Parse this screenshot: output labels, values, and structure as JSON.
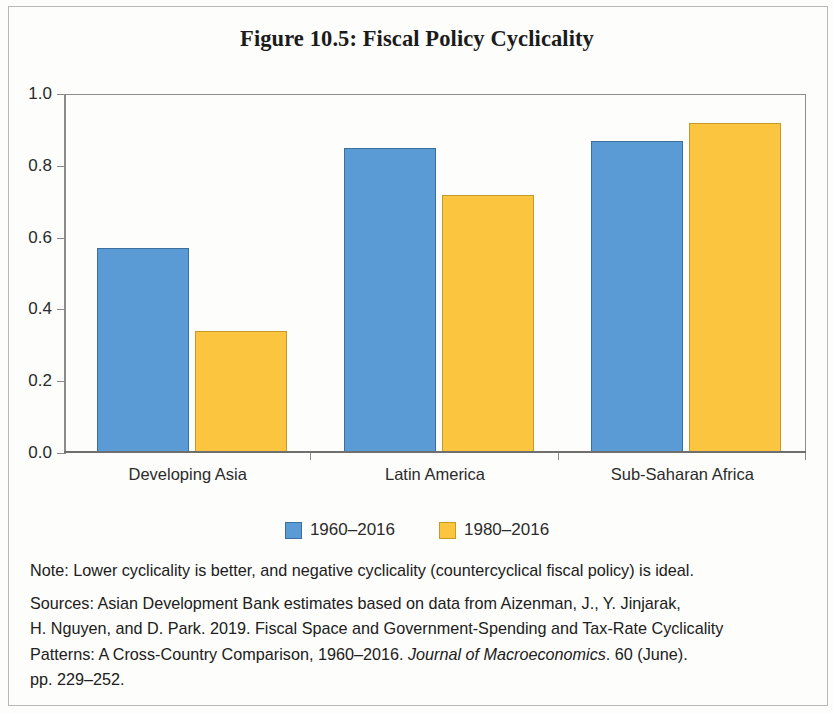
{
  "chart_data": {
    "type": "bar",
    "title": "Figure 10.5: Fiscal Policy Cyclicality",
    "subtitle": "",
    "xlabel": "",
    "ylabel": "",
    "ylim": [
      0.0,
      1.0
    ],
    "grid": false,
    "legend_position": "bottom-center",
    "categories": [
      "Developing Asia",
      "Latin America",
      "Sub-Saharan Africa"
    ],
    "y_ticks": [
      "0.0",
      "0.2",
      "0.4",
      "0.6",
      "0.8",
      "1.0"
    ],
    "y_tick_values": [
      0.0,
      0.2,
      0.4,
      0.6,
      0.8,
      1.0
    ],
    "series": [
      {
        "name": "1960–2016",
        "color": "#5B9BD5",
        "border_color": "#3D6F9E",
        "values": [
          0.57,
          0.85,
          0.87
        ]
      },
      {
        "name": "1980–2016",
        "color": "#FBC540",
        "border_color": "#C79A26",
        "values": [
          0.34,
          0.72,
          0.92
        ]
      }
    ]
  },
  "legend": [
    {
      "label": "1960–2016",
      "swatch": "s0"
    },
    {
      "label": "1980–2016",
      "swatch": "s1"
    }
  ],
  "notes": {
    "note": "Note: Lower cyclicality is better, and negative cyclicality (countercyclical fiscal policy) is ideal.",
    "sources_line1": "Sources: Asian Development Bank estimates based on data from Aizenman, J., Y. Jinjarak,",
    "sources_line2": "H. Nguyen, and D. Park. 2019. Fiscal Space and Government-Spending and Tax-Rate Cyclicality",
    "sources_line3_a": "Patterns: A Cross-Country Comparison, 1960–2016. ",
    "sources_line3_italic": "Journal of Macroeconomics",
    "sources_line3_b": ". 60 (June).",
    "sources_line4": "pp. 229–252."
  }
}
